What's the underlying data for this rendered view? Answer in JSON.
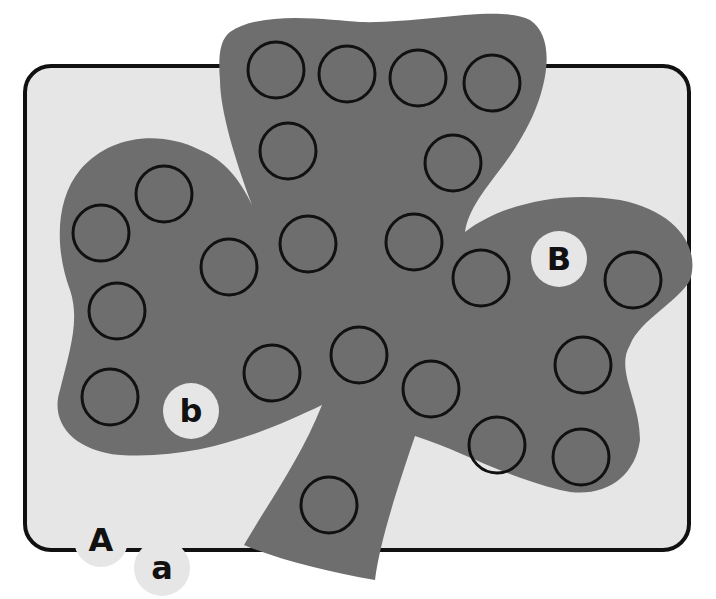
{
  "worksheet": {
    "title": "Shamrock dot marker letter activity",
    "colors": {
      "page_bg": "#ffffff",
      "card_bg": "#e6e6e6",
      "card_border": "#111111",
      "shamrock": "#6e6e6e",
      "dot_stroke": "#111111",
      "letter_disc": "#e6e6e6",
      "letter_text": "#111111"
    },
    "letter_discs": [
      {
        "label": "B",
        "cx": 559,
        "cy": 259,
        "r": 28
      },
      {
        "label": "b",
        "cx": 191,
        "cy": 411,
        "r": 28
      },
      {
        "label": "A",
        "cx": 101,
        "cy": 540,
        "r": 27
      },
      {
        "label": "a",
        "cx": 162,
        "cy": 568,
        "r": 28
      }
    ],
    "dots": [
      {
        "cx": 276,
        "cy": 70
      },
      {
        "cx": 347,
        "cy": 74
      },
      {
        "cx": 418,
        "cy": 78
      },
      {
        "cx": 492,
        "cy": 83
      },
      {
        "cx": 288,
        "cy": 151
      },
      {
        "cx": 453,
        "cy": 163
      },
      {
        "cx": 164,
        "cy": 194
      },
      {
        "cx": 101,
        "cy": 233
      },
      {
        "cx": 308,
        "cy": 244
      },
      {
        "cx": 414,
        "cy": 242
      },
      {
        "cx": 229,
        "cy": 267
      },
      {
        "cx": 481,
        "cy": 278
      },
      {
        "cx": 633,
        "cy": 280
      },
      {
        "cx": 117,
        "cy": 311
      },
      {
        "cx": 359,
        "cy": 355
      },
      {
        "cx": 272,
        "cy": 373
      },
      {
        "cx": 583,
        "cy": 365
      },
      {
        "cx": 110,
        "cy": 397
      },
      {
        "cx": 431,
        "cy": 389
      },
      {
        "cx": 497,
        "cy": 445
      },
      {
        "cx": 581,
        "cy": 457
      },
      {
        "cx": 329,
        "cy": 505
      }
    ],
    "dot_radius": 28
  }
}
